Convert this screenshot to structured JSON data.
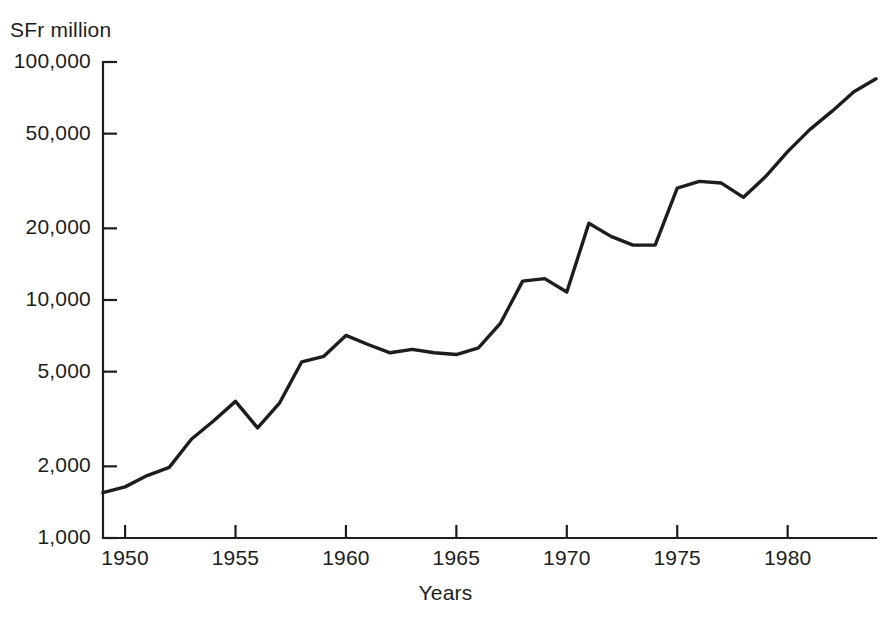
{
  "chart_data": {
    "type": "line",
    "title": "",
    "subtitle": "",
    "xlabel": "Years",
    "ylabel": "SFr million",
    "yscale": "log",
    "grid": false,
    "legend": null,
    "xlim": [
      1949,
      1984
    ],
    "ylim": [
      1000,
      100000
    ],
    "xticks": [
      1950,
      1955,
      1960,
      1965,
      1970,
      1975,
      1980
    ],
    "xtick_labels": [
      "1950",
      "1955",
      "1960",
      "1965",
      "1970",
      "1975",
      "1980"
    ],
    "yticks": [
      1000,
      2000,
      5000,
      10000,
      20000,
      50000,
      100000
    ],
    "ytick_labels": [
      "1,000",
      "2,000",
      "5,000",
      "10,000",
      "20,000",
      "50,000",
      "100,000"
    ],
    "x": [
      1949,
      1950,
      1951,
      1952,
      1953,
      1954,
      1955,
      1956,
      1957,
      1958,
      1959,
      1960,
      1961,
      1962,
      1963,
      1964,
      1965,
      1966,
      1967,
      1968,
      1969,
      1970,
      1971,
      1972,
      1973,
      1974,
      1975,
      1976,
      1977,
      1978,
      1979,
      1980,
      1981,
      1982,
      1983,
      1984
    ],
    "values": [
      1550,
      1640,
      1830,
      1980,
      2600,
      3100,
      3750,
      2900,
      3700,
      5500,
      5800,
      7100,
      6500,
      6000,
      6200,
      6000,
      5900,
      6300,
      8000,
      12000,
      12300,
      10800,
      21000,
      18500,
      17000,
      17000,
      29500,
      31500,
      31000,
      27000,
      33000,
      42000,
      52000,
      62000,
      75000,
      85000
    ],
    "series_name": "SFr million"
  },
  "axis_titles": {
    "y": "SFr million",
    "x": "Years"
  }
}
